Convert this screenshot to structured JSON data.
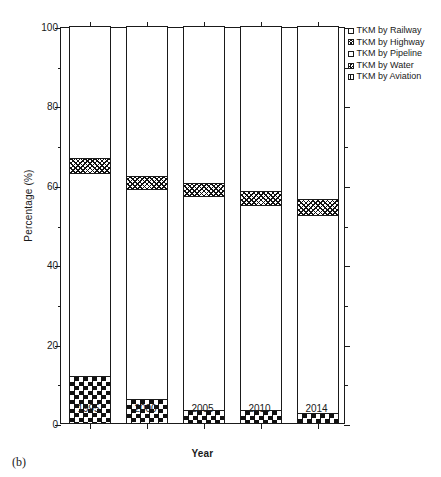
{
  "figure": {
    "panel_label": "(b)"
  },
  "chart_data": {
    "type": "bar",
    "stacked": true,
    "title": "",
    "xlabel": "Year",
    "ylabel": "Percentage (%)",
    "categories": [
      "1995",
      "2000",
      "2005",
      "2010",
      "2014"
    ],
    "ylim": [
      0,
      100
    ],
    "yticks": [
      0,
      20,
      40,
      60,
      80,
      100
    ],
    "ytick_labels": [
      "0",
      "20",
      "40",
      "60",
      "80",
      "100"
    ],
    "yminor_step": 10,
    "grid": false,
    "legend_position": "upper-right-outside",
    "series": [
      {
        "name": "TKM by Railway",
        "pattern": "open",
        "values": [
          0.0,
          0.0,
          0.0,
          0.0,
          0.0
        ]
      },
      {
        "name": "TKM by Highway",
        "pattern": "crosshatch",
        "values": [
          3.8,
          3.3,
          3.3,
          3.5,
          4.0
        ]
      },
      {
        "name": "TKM by Pipeline",
        "pattern": "open",
        "values": [
          51.2,
          52.9,
          53.9,
          51.6,
          49.9
        ]
      },
      {
        "name": "TKM by Water",
        "pattern": "checker",
        "values": [
          11.8,
          6.0,
          3.3,
          3.3,
          2.5
        ]
      },
      {
        "name": "TKM by Aviation",
        "pattern": "speckle",
        "values": [
          33.2,
          37.8,
          39.5,
          41.6,
          43.6
        ]
      }
    ],
    "stack_tops": {
      "water": [
        11.8,
        6.0,
        3.3,
        3.3,
        2.5
      ],
      "pipeline": [
        63.0,
        58.9,
        57.2,
        54.9,
        52.4
      ],
      "highway": [
        66.8,
        62.2,
        60.5,
        58.4,
        56.4
      ],
      "aviation": [
        100.0,
        100.0,
        100.0,
        100.0,
        100.0
      ]
    }
  },
  "legend": {
    "items": [
      {
        "label": "TKM by Railway",
        "swatch": "sw-railway"
      },
      {
        "label": "TKM by Highway",
        "swatch": "sw-highway"
      },
      {
        "label": "TKM by Pipeline",
        "swatch": "sw-pipeline"
      },
      {
        "label": "TKM by Water",
        "swatch": "sw-water"
      },
      {
        "label": "TKM by Aviation",
        "swatch": "sw-aviation"
      }
    ]
  }
}
